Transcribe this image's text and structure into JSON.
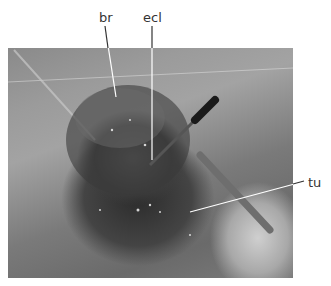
{
  "figure": {
    "labels": [
      {
        "id": "br",
        "text": "br"
      },
      {
        "id": "ecl",
        "text": "ecl"
      },
      {
        "id": "tu",
        "text": "tu"
      }
    ],
    "image_description": "grayscale intraoperative photograph"
  }
}
